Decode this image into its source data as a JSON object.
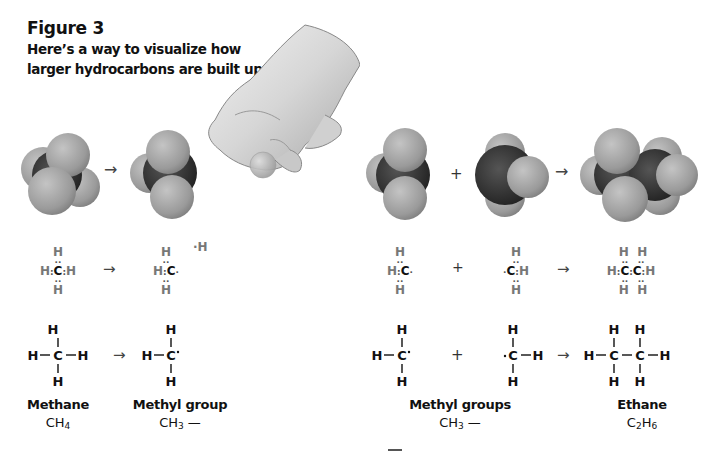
{
  "figure": {
    "title": "Figure 3",
    "subtitle_line1": "Here’s a way to visualize how",
    "subtitle_line2": "larger hydrocarbons are built up."
  },
  "symbols": {
    "arrow": "→",
    "plus": "+",
    "dash": "—",
    "bond_h": "—",
    "bond_v": "|"
  },
  "atoms": {
    "H": "H",
    "C": "C",
    "H_radical": "·H"
  },
  "labels": {
    "methane": "Methane",
    "methane_formula_base": "CH",
    "methane_formula_sub": "4",
    "methyl_group": "Methyl group",
    "methyl_formula_base": "CH",
    "methyl_formula_sub": "3",
    "methyl_formula_tail": " —",
    "methyl_groups": "Methyl groups",
    "ethane": "Ethane",
    "ethane_formula_c": "C",
    "ethane_formula_c_sub": "2",
    "ethane_formula_h": "H",
    "ethane_formula_h_sub": "6"
  },
  "colors": {
    "hydrogen_sphere": "#9a9a9a",
    "carbon_sphere": "#2a2a2a",
    "lewis_h": "#777777",
    "text": "#111111"
  }
}
